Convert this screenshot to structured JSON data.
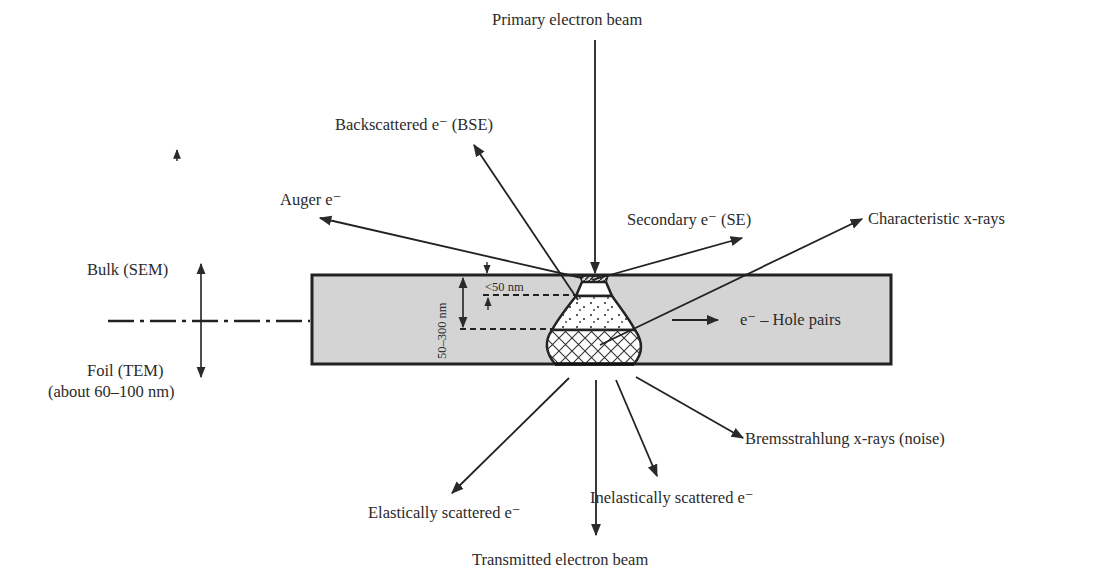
{
  "labels": {
    "primary_beam": "Primary electron beam",
    "bse": "Backscattered e⁻ (BSE)",
    "auger": "Auger e⁻",
    "se": "Secondary e⁻ (SE)",
    "char_xray": "Characteristic x-rays",
    "hole_pairs": "e⁻ – Hole pairs",
    "bulk": "Bulk (SEM)",
    "foil": "Foil (TEM)",
    "foil_thickness": "(about 60–100 nm)",
    "depth_small": "<50 nm",
    "depth_large": "50–300 nm",
    "brems": "Bremsstrahlung x-rays (noise)",
    "elastic": "Elastically scattered e⁻",
    "inelastic": "Inelastically scattered e⁻",
    "transmitted": "Transmitted electron beam"
  },
  "colors": {
    "specimen_fill": "#d4d4d4",
    "line": "#2a2a2a",
    "volume_fill": "#ffffff"
  }
}
